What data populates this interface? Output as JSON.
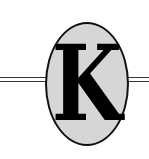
{
  "logo": {
    "letter": "K",
    "colors": {
      "ellipse_fill": "#d6d6d6",
      "outline": "#111111",
      "letter": "#000000"
    }
  }
}
